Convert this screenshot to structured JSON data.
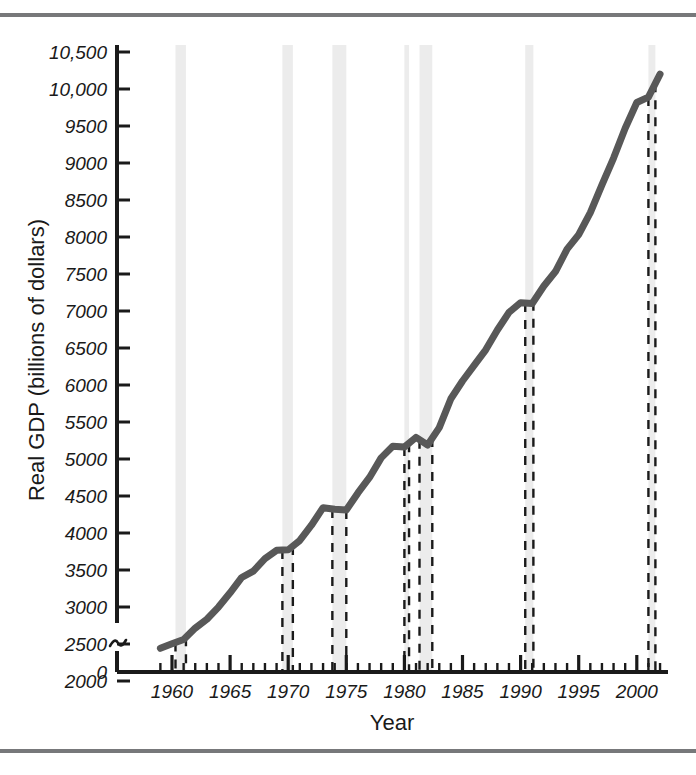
{
  "figure": {
    "name": "real-gdp-time-series",
    "top_rule_color": "#77787a",
    "bottom_rule_color": "#77787a",
    "background": "#ffffff"
  },
  "chart_data": {
    "type": "line",
    "title": "",
    "xlabel": "Year",
    "ylabel": "Real GDP (billions of dollars)",
    "xlim": [
      1959,
      2002.5
    ],
    "ylim": [
      2000,
      10600
    ],
    "grid": false,
    "legend": null,
    "line_color": "#585858",
    "line_width": 7,
    "axis_break": {
      "axis": "y",
      "symbol": "squiggle",
      "between": [
        0,
        2000
      ]
    },
    "ytick_labels": [
      "0",
      "2000",
      "2500",
      "3000",
      "3500",
      "4000",
      "4500",
      "5000",
      "5500",
      "6000",
      "6500",
      "7000",
      "7500",
      "8000",
      "8500",
      "9000",
      "9500",
      "10,000",
      "10,500"
    ],
    "ytick_values": [
      0,
      2000,
      2500,
      3000,
      3500,
      4000,
      4500,
      5000,
      5500,
      6000,
      6500,
      7000,
      7500,
      8000,
      8500,
      9000,
      9500,
      10000,
      10500
    ],
    "xtick_labels": [
      "1960",
      "1965",
      "1970",
      "1975",
      "1980",
      "1985",
      "1990",
      "1995",
      "2000"
    ],
    "xtick_values": [
      1960,
      1965,
      1970,
      1975,
      1980,
      1985,
      1990,
      1995,
      2000
    ],
    "x_minor_step": 1,
    "x": [
      1959,
      1960,
      1961,
      1962,
      1963,
      1964,
      1965,
      1966,
      1967,
      1968,
      1969,
      1970,
      1971,
      1972,
      1973,
      1974,
      1975,
      1976,
      1977,
      1978,
      1979,
      1980,
      1981,
      1982,
      1983,
      1984,
      1985,
      1986,
      1987,
      1988,
      1989,
      1990,
      1991,
      1992,
      1993,
      1994,
      1995,
      1996,
      1997,
      1998,
      1999,
      2000,
      2001,
      2002
    ],
    "values": [
      2442,
      2502,
      2560,
      2715,
      2834,
      2999,
      3192,
      3399,
      3485,
      3653,
      3766,
      3772,
      3899,
      4105,
      4342,
      4320,
      4311,
      4541,
      4751,
      5015,
      5173,
      5162,
      5292,
      5189,
      5424,
      5814,
      6054,
      6264,
      6475,
      6743,
      6981,
      7113,
      7101,
      7337,
      7533,
      7836,
      8032,
      8329,
      8704,
      9067,
      9470,
      9817,
      9891,
      10200
    ],
    "series": [
      {
        "name": "Real GDP",
        "values": [
          2442,
          2502,
          2560,
          2715,
          2834,
          2999,
          3192,
          3399,
          3485,
          3653,
          3766,
          3772,
          3899,
          4105,
          4342,
          4320,
          4311,
          4541,
          4751,
          5015,
          5173,
          5162,
          5292,
          5189,
          5424,
          5814,
          6054,
          6264,
          6475,
          6743,
          6981,
          7113,
          7101,
          7337,
          7533,
          7836,
          8032,
          8329,
          8704,
          9067,
          9470,
          9817,
          9891,
          10200
        ]
      }
    ],
    "recession_bands": [
      {
        "label": "1960-61",
        "start": 1960.3,
        "end": 1961.2
      },
      {
        "label": "1969-70",
        "start": 1969.5,
        "end": 1970.4
      },
      {
        "label": "1973-75",
        "start": 1973.8,
        "end": 1975.0
      },
      {
        "label": "1980",
        "start": 1980.0,
        "end": 1980.4
      },
      {
        "label": "1981-82",
        "start": 1981.3,
        "end": 1982.4
      },
      {
        "label": "1990-91",
        "start": 1990.4,
        "end": 1991.1
      },
      {
        "label": "2001",
        "start": 2001.0,
        "end": 2001.6
      }
    ],
    "recession_band_fill": "#ececec",
    "recession_band_line_style": "dashed",
    "recession_band_line_color": "#1a1a1a"
  }
}
